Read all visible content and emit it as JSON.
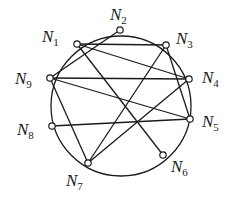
{
  "diagram": {
    "type": "graph",
    "circle": {
      "cx": 121,
      "cy": 106,
      "r": 70
    },
    "nodes": [
      {
        "id": "N1",
        "letter": "N",
        "sub": "1",
        "x": 77,
        "y": 44,
        "lx": 42,
        "ly": 42
      },
      {
        "id": "N2",
        "letter": "N",
        "sub": "2",
        "x": 120,
        "y": 30,
        "lx": 110,
        "ly": 20
      },
      {
        "id": "N3",
        "letter": "N",
        "sub": "3",
        "x": 166,
        "y": 45,
        "lx": 176,
        "ly": 44
      },
      {
        "id": "N4",
        "letter": "N",
        "sub": "4",
        "x": 189,
        "y": 79,
        "lx": 202,
        "ly": 83
      },
      {
        "id": "N5",
        "letter": "N",
        "sub": "5",
        "x": 190,
        "y": 119,
        "lx": 202,
        "ly": 127
      },
      {
        "id": "N6",
        "letter": "N",
        "sub": "6",
        "x": 163,
        "y": 155,
        "lx": 171,
        "ly": 172
      },
      {
        "id": "N7",
        "letter": "N",
        "sub": "7",
        "x": 88,
        "y": 163,
        "lx": 66,
        "ly": 186
      },
      {
        "id": "N8",
        "letter": "N",
        "sub": "8",
        "x": 52,
        "y": 126,
        "lx": 17,
        "ly": 135
      },
      {
        "id": "N9",
        "letter": "N",
        "sub": "9",
        "x": 50,
        "y": 78,
        "lx": 15,
        "ly": 84
      }
    ],
    "edges": [
      [
        "N2",
        "N9"
      ],
      [
        "N1",
        "N3"
      ],
      [
        "N1",
        "N4"
      ],
      [
        "N1",
        "N6"
      ],
      [
        "N9",
        "N4"
      ],
      [
        "N9",
        "N5"
      ],
      [
        "N9",
        "N7"
      ],
      [
        "N8",
        "N5"
      ],
      [
        "N3",
        "N7"
      ],
      [
        "N3",
        "N5"
      ],
      [
        "N4",
        "N7"
      ]
    ],
    "colors": {
      "stroke": "#1a1a1a",
      "background": "#ffffff"
    }
  }
}
